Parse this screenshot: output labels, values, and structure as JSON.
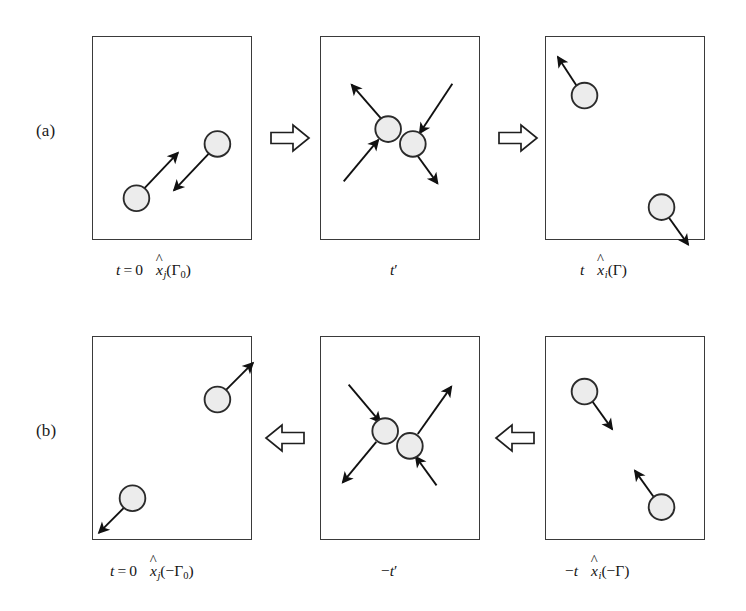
{
  "figure": {
    "title_semantics": "time-reversal symmetry of a two-particle collision",
    "background_color": "#ffffff",
    "panel_border_color": "#3a3a3a",
    "particle_fill_color": "#ececec",
    "particle_stroke_color": "#2b2b2b",
    "arrow_color": "#111111",
    "block_arrow_fill": "#ffffff",
    "block_arrow_stroke": "#1f1f1f"
  },
  "rows": [
    {
      "id": "a",
      "label": "(a)",
      "flow_direction": "right",
      "block_arrow_glyph": "right-block-arrow",
      "panels": [
        {
          "id": "a1",
          "name": "initial-state-panel",
          "caption": {
            "time": "t = 0",
            "state_var": "x",
            "state_sub": "j",
            "state_arg": "Γ",
            "state_arg_sub": "0",
            "arg_sign": "",
            "full_text": "t = 0   x̂j(Γ0)"
          },
          "particles": [
            {
              "id": "p1",
              "cx": 126,
              "cy": 108,
              "r": 13,
              "arrow_dx": -40,
              "arrow_dy": 44
            },
            {
              "id": "p2",
              "cx": 44,
              "cy": 163,
              "r": 13,
              "arrow_dx": 40,
              "arrow_dy": -44
            }
          ]
        },
        {
          "id": "a2",
          "name": "collision-panel",
          "caption": {
            "time": "t′",
            "full_text": "t′"
          },
          "particles": [
            {
              "id": "p1",
              "cx": 68,
              "cy": 93,
              "r": 13
            },
            {
              "id": "p2",
              "cx": 93,
              "cy": 108,
              "r": 13
            }
          ]
        },
        {
          "id": "a3",
          "name": "final-state-panel",
          "caption": {
            "time": "t",
            "state_var": "x",
            "state_sub": "i",
            "state_arg": "Γ",
            "state_arg_sub": "",
            "arg_sign": "",
            "full_text": "t   x̂i(Γ)"
          },
          "particles": [
            {
              "id": "p1",
              "cx": 39,
              "cy": 59,
              "r": 13,
              "arrow_dx": -25,
              "arrow_dy": -36
            },
            {
              "id": "p2",
              "cx": 117,
              "cy": 172,
              "r": 13,
              "arrow_dx": 25,
              "arrow_dy": 36
            }
          ]
        }
      ]
    },
    {
      "id": "b",
      "label": "(b)",
      "flow_direction": "left",
      "block_arrow_glyph": "left-block-arrow",
      "panels": [
        {
          "id": "b1",
          "name": "time-reversed-initial-state-panel",
          "caption": {
            "time": "t = 0",
            "state_var": "x",
            "state_sub": "j",
            "state_arg": "Γ",
            "state_arg_sub": "0",
            "arg_sign": "−",
            "full_text": "t = 0   x̂j(−Γ0)"
          },
          "particles": [
            {
              "id": "p1",
              "cx": 126,
              "cy": 63,
              "r": 13,
              "arrow_dx": 34,
              "arrow_dy": -34
            },
            {
              "id": "p2",
              "cx": 40,
              "cy": 163,
              "r": 13,
              "arrow_dx": -34,
              "arrow_dy": 34
            }
          ]
        },
        {
          "id": "b2",
          "name": "time-reversed-collision-panel",
          "caption": {
            "time": "−t′",
            "full_text": "−t′"
          },
          "particles": [
            {
              "id": "p1",
              "cx": 65,
              "cy": 95,
              "r": 13
            },
            {
              "id": "p2",
              "cx": 90,
              "cy": 110,
              "r": 13
            }
          ]
        },
        {
          "id": "b3",
          "name": "time-reversed-final-state-panel",
          "caption": {
            "time": "−t",
            "state_var": "x",
            "state_sub": "i",
            "state_arg": "Γ",
            "state_arg_sub": "",
            "arg_sign": "−",
            "full_text": "−t   x̂i(−Γ)"
          },
          "particles": [
            {
              "id": "p1",
              "cx": 39,
              "cy": 55,
              "r": 13,
              "arrow_dx": 25,
              "arrow_dy": 36
            },
            {
              "id": "p2",
              "cx": 117,
              "cy": 172,
              "r": 13,
              "arrow_dx": -25,
              "arrow_dy": -36
            }
          ]
        }
      ]
    }
  ]
}
